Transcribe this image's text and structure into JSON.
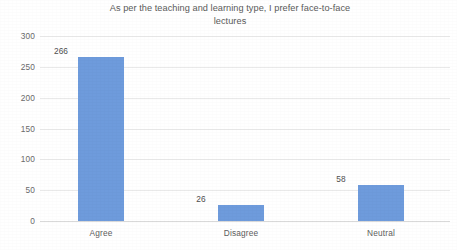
{
  "chart_data": {
    "type": "bar",
    "title": "As per the teaching and learning type, I prefer face-to-face\nlectures",
    "title_line_1": "As per the teaching and learning type, I prefer face-to-face",
    "title_line_2": "lectures",
    "categories": [
      "Agree",
      "Disagree",
      "Neutral"
    ],
    "values": [
      266,
      26,
      58
    ],
    "data_labels": [
      "266",
      "26",
      "58"
    ],
    "xlabel": "",
    "ylabel": "",
    "ylim": [
      0,
      300
    ],
    "ytick_labels": [
      "300",
      "250",
      "200",
      "150",
      "100",
      "50",
      "0"
    ],
    "ytick_values": [
      300,
      250,
      200,
      150,
      100,
      50,
      0
    ],
    "ytick_step": 50,
    "grid": "horizontal",
    "legend": "none",
    "series": [
      {
        "name": "Responses",
        "values": [
          266,
          26,
          58
        ],
        "color": "#6E9BDC"
      }
    ],
    "colors": {
      "bar": "#6E9BDC",
      "gridline": "#E9E9E9",
      "title_text": "#5A5A5A",
      "tick_text": "#6A6A6A",
      "label_text": "#4E4E4E",
      "background": "#FFFFFF"
    }
  }
}
